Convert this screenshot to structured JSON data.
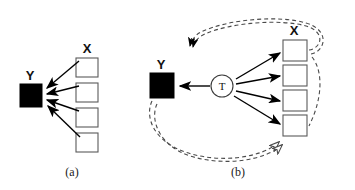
{
  "figure": {
    "background_color": "#ffffff",
    "ink_color": "#000000",
    "dashed_color": "#4a4a4a",
    "outline_color": "#5a5a5a",
    "panels": [
      {
        "id": "panel-a",
        "caption": "(a)",
        "caption_x": 72,
        "caption_y": 176,
        "nodes": [
          {
            "id": "y-node-a",
            "label": "Y",
            "shape": "filled-square",
            "label_x": 30,
            "label_y": 80,
            "x": 20,
            "y": 84,
            "width": 22,
            "height": 23
          },
          {
            "id": "x-group-a",
            "label": "X",
            "shape": "open-square-stack",
            "label_x": 87,
            "label_y": 53,
            "x": 76,
            "y": 58,
            "box_width": 22,
            "box_height": 19,
            "gap": 6,
            "count": 4
          }
        ],
        "arrows": [
          {
            "id": "x1-to-y",
            "from": "x-box-1",
            "to": "y-node-a",
            "style": "solid",
            "x1": 78,
            "y1": 60,
            "x2": 45,
            "y2": 88
          },
          {
            "id": "x2-to-y",
            "from": "x-box-2",
            "to": "y-node-a",
            "style": "solid",
            "x1": 78,
            "y1": 85,
            "x2": 45,
            "y2": 94
          },
          {
            "id": "x3-to-y",
            "from": "x-box-3",
            "to": "y-node-a",
            "style": "solid",
            "x1": 78,
            "y1": 110,
            "x2": 45,
            "y2": 100
          },
          {
            "id": "x4-to-y",
            "from": "x-box-4",
            "to": "y-node-a",
            "style": "solid",
            "x1": 78,
            "y1": 135,
            "x2": 46,
            "y2": 106
          }
        ]
      },
      {
        "id": "panel-b",
        "caption": "(b)",
        "caption_x": 238,
        "caption_y": 176,
        "nodes": [
          {
            "id": "y-node-b",
            "label": "Y",
            "shape": "filled-square",
            "label_x": 161,
            "label_y": 69,
            "x": 150,
            "y": 73,
            "width": 24,
            "height": 25
          },
          {
            "id": "t-node",
            "label": "T",
            "shape": "circle",
            "cx": 222,
            "cy": 86,
            "r": 11
          },
          {
            "id": "x-group-b",
            "label": "X",
            "shape": "open-square-stack",
            "label_x": 294,
            "label_y": 35,
            "x": 283,
            "y": 40,
            "box_width": 24,
            "box_height": 21,
            "gap": 4,
            "count": 4
          }
        ],
        "arrows": [
          {
            "id": "t-to-y",
            "from": "t-node",
            "to": "y-node-b",
            "style": "solid",
            "x1": 210,
            "y1": 86,
            "x2": 178,
            "y2": 86
          },
          {
            "id": "t-to-x1",
            "from": "t-node",
            "to": "x-box-1",
            "style": "solid",
            "x1": 232,
            "y1": 79,
            "x2": 279,
            "y2": 53
          },
          {
            "id": "t-to-x2",
            "from": "t-node",
            "to": "x-box-2",
            "style": "solid",
            "x1": 234,
            "y1": 84,
            "x2": 280,
            "y2": 76
          },
          {
            "id": "t-to-x3",
            "from": "t-node",
            "to": "x-box-3",
            "style": "solid",
            "x1": 234,
            "y1": 91,
            "x2": 280,
            "y2": 101
          },
          {
            "id": "t-to-x4",
            "from": "t-node",
            "to": "x-box-4",
            "style": "solid",
            "x1": 231,
            "y1": 96,
            "x2": 279,
            "y2": 124
          }
        ],
        "feedback_loops": [
          {
            "id": "top-feedback-loop",
            "style": "dashed",
            "description": "loop from top X box curving left with arrowhead pointing left-down",
            "arrow_end": "solid"
          },
          {
            "id": "bottom-feedback-loop",
            "style": "dashed",
            "description": "loop from Y node curving down and right with open arrowhead pointing up-right at bottom X box",
            "arrow_end": "open"
          }
        ]
      }
    ]
  }
}
